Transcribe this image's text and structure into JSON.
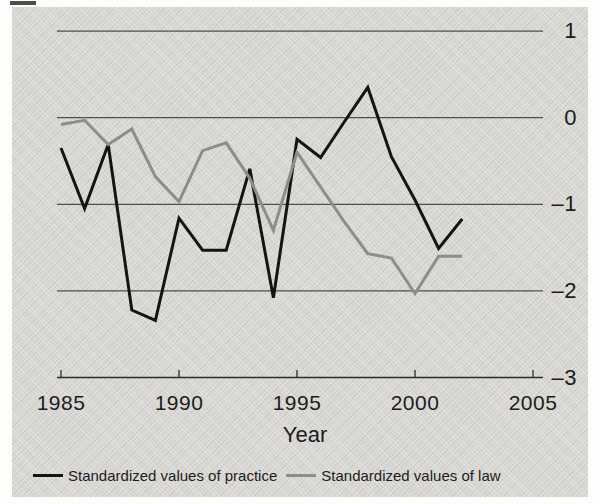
{
  "figure": {
    "xlabel": "Year",
    "legend": [
      {
        "label": "Standardized values of practice",
        "series": "practice"
      },
      {
        "label": "Standardized values of law",
        "series": "law"
      }
    ]
  },
  "colors": {
    "practice": "#141414",
    "law": "#8d8d8d",
    "gridline": "#4f4f4d",
    "axis": "#2b2b2b",
    "panel_bg": "#d8d6d2",
    "page_bg": "#fdfdfc",
    "text": "#1c1c1c"
  },
  "chart_data": {
    "type": "line",
    "title": "",
    "xlabel": "Year",
    "ylabel": "",
    "x": [
      1985,
      1986,
      1987,
      1988,
      1989,
      1990,
      1991,
      1992,
      1993,
      1994,
      1995,
      1996,
      1997,
      1998,
      1999,
      2000,
      2001,
      2002
    ],
    "series": [
      {
        "name": "Standardized values of practice",
        "color_key": "practice",
        "values": [
          -0.35,
          -1.05,
          -0.31,
          -2.22,
          -2.34,
          -1.16,
          -1.53,
          -1.53,
          -0.59,
          -2.08,
          -0.25,
          -0.46,
          -0.05,
          0.35,
          -0.45,
          -0.95,
          -1.51,
          -1.17
        ]
      },
      {
        "name": "Standardized values of law",
        "color_key": "law",
        "values": [
          -0.08,
          -0.03,
          -0.31,
          -0.13,
          -0.68,
          -0.97,
          -0.38,
          -0.29,
          -0.7,
          -1.3,
          -0.4,
          -0.8,
          -1.2,
          -1.57,
          -1.62,
          -2.03,
          -1.6,
          -1.6
        ]
      }
    ],
    "xlim": [
      1985,
      2005
    ],
    "ylim": [
      -3,
      1
    ],
    "x_ticks": [
      1985,
      1990,
      1995,
      2000,
      2005
    ],
    "x_tick_labels": [
      "1985",
      "1990",
      "1995",
      "2000",
      "2005"
    ],
    "y_gridlines": [
      1,
      0,
      -1,
      -2
    ],
    "y_ticks": [
      1,
      0,
      -1,
      -2,
      -3
    ],
    "y_tick_labels": [
      "1",
      "0",
      "–1",
      "–2",
      "–3"
    ],
    "grid": "horizontal-only",
    "legend_position": "bottom-left"
  }
}
